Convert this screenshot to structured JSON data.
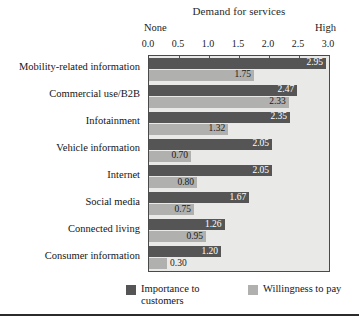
{
  "chart_data": {
    "type": "bar",
    "orientation": "horizontal",
    "title": "Demand for services",
    "xlabel": "",
    "ylabel": "",
    "xlim": [
      0.0,
      3.0
    ],
    "xticks": [
      "0.0",
      "0.5",
      "1.0",
      "1.5",
      "2.0",
      "2.5",
      "3.0"
    ],
    "xtick_values": [
      0.0,
      0.5,
      1.0,
      1.5,
      2.0,
      2.5,
      3.0
    ],
    "axis_anchor_low": "None",
    "axis_anchor_high": "High",
    "grid": false,
    "legend_position": "bottom",
    "categories": [
      "Mobility-related information",
      "Commercial use/B2B",
      "Infotainment",
      "Vehicle information",
      "Internet",
      "Social media",
      "Connected living",
      "Consumer information"
    ],
    "series": [
      {
        "name": "Importance to customers",
        "color": "#555555",
        "values": [
          2.95,
          2.47,
          2.35,
          2.05,
          2.05,
          1.67,
          1.26,
          1.2
        ],
        "labels": [
          "2.95",
          "2.47",
          "2.35",
          "2.05",
          "2.05",
          "1.67",
          "1.26",
          "1.20"
        ]
      },
      {
        "name": "Willingness to pay",
        "color": "#b0b0ae",
        "values": [
          1.75,
          2.33,
          1.32,
          0.7,
          0.8,
          0.75,
          0.95,
          0.3
        ],
        "labels": [
          "1.75",
          "2.33",
          "1.32",
          "0.70",
          "0.80",
          "0.75",
          "0.95",
          "0.30"
        ]
      }
    ]
  },
  "legend": {
    "items": [
      {
        "label": "Importance to customers",
        "color": "#555555"
      },
      {
        "label": "Willingness to pay",
        "color": "#b0b0ae"
      }
    ]
  }
}
